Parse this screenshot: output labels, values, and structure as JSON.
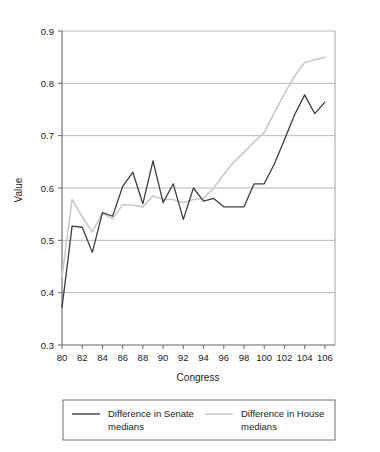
{
  "chart_data": {
    "type": "line",
    "title": "",
    "xlabel": "Congress",
    "ylabel": "Value",
    "xlim": [
      80,
      107
    ],
    "ylim": [
      0.3,
      0.9
    ],
    "grid": true,
    "grid_axis": "y",
    "legend_position": "bottom",
    "xticks": [
      80,
      82,
      84,
      86,
      88,
      90,
      92,
      94,
      96,
      98,
      100,
      102,
      104,
      106
    ],
    "xtick_labels": [
      "80",
      "82",
      "84",
      "86",
      "88",
      "90",
      "92",
      "94",
      "96",
      "98",
      "100",
      "102",
      "104",
      "106"
    ],
    "yticks": [
      0.3,
      0.4,
      0.5,
      0.6,
      0.7,
      0.8,
      0.9
    ],
    "ytick_labels": [
      "0.3",
      "0.4",
      "0.5",
      "0.6",
      "0.7",
      "0.8",
      "0.9"
    ],
    "x": [
      80,
      81,
      82,
      83,
      84,
      85,
      86,
      87,
      88,
      89,
      90,
      91,
      92,
      93,
      94,
      95,
      96,
      97,
      98,
      99,
      100,
      101,
      102,
      103,
      104,
      105,
      106
    ],
    "series": [
      {
        "name": "Difference in Senate medians",
        "color": "#3d3d3d",
        "width": 1.3,
        "values": [
          0.372,
          0.527,
          0.525,
          0.477,
          0.553,
          0.546,
          0.603,
          0.63,
          0.57,
          0.652,
          0.572,
          0.608,
          0.54,
          0.6,
          0.575,
          0.58,
          0.564,
          0.564,
          0.564,
          0.608,
          0.608,
          0.646,
          0.692,
          0.74,
          0.778,
          0.742,
          0.764
        ]
      },
      {
        "name": "Difference in House medians",
        "color": "#c9c9c9",
        "width": 1.6,
        "values": [
          0.43,
          0.578,
          0.545,
          0.516,
          0.552,
          0.541,
          0.568,
          0.567,
          0.564,
          0.585,
          0.578,
          0.578,
          0.572,
          0.578,
          0.58,
          0.6,
          0.626,
          0.65,
          0.668,
          0.688,
          0.706,
          0.744,
          0.78,
          0.814,
          0.84,
          0.845,
          0.85
        ]
      }
    ]
  },
  "legend": {
    "entries": [
      {
        "label_line1": "Difference in Senate",
        "label_line2": "medians",
        "swatch": "senate-line-swatch"
      },
      {
        "label_line1": "Difference in House",
        "label_line2": "medians",
        "swatch": "house-line-swatch"
      }
    ]
  },
  "colors": {
    "senate": "#3d3d3d",
    "house": "#c9c9c9",
    "grid": "#b0b0b0",
    "axis": "#666666",
    "text": "#1a1a1a",
    "legend_border": "#707070",
    "background": "#ffffff"
  }
}
